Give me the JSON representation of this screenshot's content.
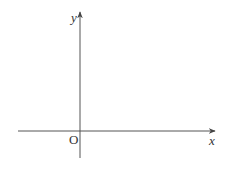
{
  "diagram": {
    "type": "coordinate-axes",
    "colors": {
      "axis": "#555555",
      "label": "#333333",
      "background": "#ffffff"
    },
    "x_axis": {
      "label": "x",
      "from": [
        18,
        131
      ],
      "to": [
        215,
        131
      ]
    },
    "y_axis": {
      "label": "y",
      "from": [
        80,
        158
      ],
      "to": [
        80,
        12
      ]
    },
    "origin": {
      "label": "O",
      "position": [
        80,
        131
      ]
    }
  }
}
